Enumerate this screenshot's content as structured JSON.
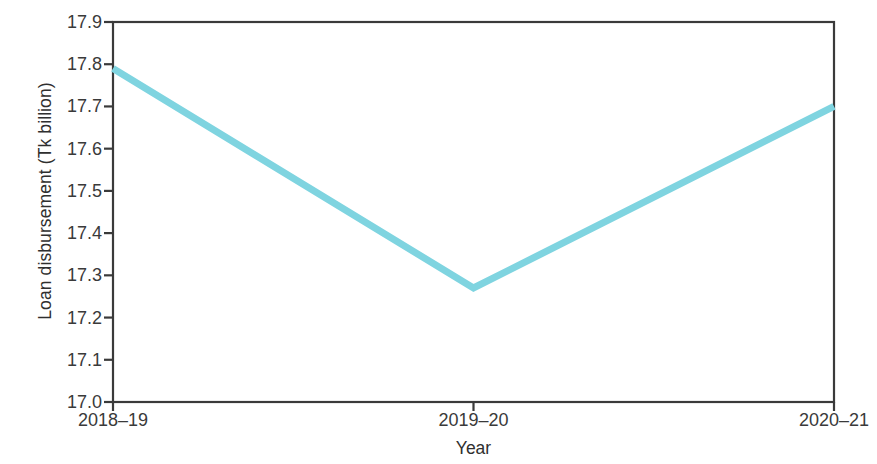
{
  "chart_data": {
    "type": "line",
    "title": "",
    "xlabel": "Year",
    "ylabel": "Loan disbursement (Tk billion)",
    "categories": [
      "2018–19",
      "2019–20",
      "2020–21"
    ],
    "values": [
      17.79,
      17.27,
      17.7
    ],
    "series": [
      {
        "name": "Loan disbursement",
        "values": [
          17.79,
          17.27,
          17.7
        ],
        "color": "#7FD4E0"
      }
    ],
    "ylim": [
      17.0,
      17.9
    ],
    "ytick_values": [
      17.0,
      17.1,
      17.2,
      17.3,
      17.4,
      17.5,
      17.6,
      17.7,
      17.8,
      17.9
    ],
    "ytick_labels": [
      "17.0",
      "17.1",
      "17.2",
      "17.3",
      "17.4",
      "17.5",
      "17.6",
      "17.7",
      "17.8",
      "17.9"
    ],
    "xtick_labels": [
      "2018–19",
      "2019–20",
      "2020–21"
    ],
    "grid": false,
    "legend": false,
    "legend_position": "none",
    "axis_frame": "full-box",
    "line_width_px": 7,
    "axis_color": "#3a3a3a",
    "background_color": "#ffffff"
  },
  "figure": {
    "ylabel_text": "Loan disbursement (Tk billion)",
    "xlabel_text": "Year"
  }
}
